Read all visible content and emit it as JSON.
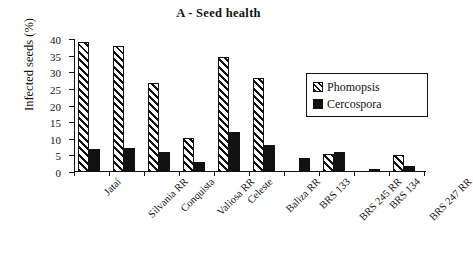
{
  "chart_data": {
    "type": "bar",
    "title": "A - Seed health",
    "xlabel": "",
    "ylabel": "Infected  seeds (%)",
    "ylim": [
      0,
      40
    ],
    "ytick_values": [
      0,
      5,
      10,
      15,
      20,
      25,
      30,
      35,
      40
    ],
    "ytick_labels": [
      "0",
      "5",
      "10",
      "15",
      "20",
      "25",
      "30",
      "35",
      "40"
    ],
    "grid": false,
    "legend_position": "upper-right",
    "categories": [
      "Jataí",
      "Silvania RR",
      "Conquista",
      "Valiosa RR",
      "Celeste",
      "Baliza RR",
      "BRS 133",
      "BRS 245 RR",
      "BRS 134",
      "BRS 247 RR"
    ],
    "series": [
      {
        "name": "Phomopsis",
        "fill": "diagonal-hatch",
        "values": [
          39,
          38,
          26.8,
          10.2,
          34.5,
          28.2,
          0,
          5.5,
          0,
          5
        ]
      },
      {
        "name": "Cercospora",
        "fill": "solid-black",
        "values": [
          7,
          7.2,
          6,
          2.9,
          11.9,
          8.2,
          4.2,
          6.1,
          0.8,
          1.9
        ]
      }
    ]
  },
  "legend": {
    "entries": [
      {
        "label": "Phomopsis"
      },
      {
        "label": "Cercospora"
      }
    ]
  },
  "colors": {
    "axis": "#111111",
    "series_phomopsis": "#ffffff",
    "series_cercospora": "#111111",
    "background": "#ffffff"
  }
}
